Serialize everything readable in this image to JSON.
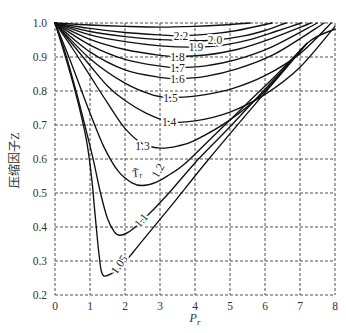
{
  "chart_data": {
    "type": "line",
    "title": "",
    "xlabel": "P_r",
    "xlabel_main": "P",
    "xlabel_sub": "r",
    "ylabel": "压缩因子Z",
    "xlim": [
      0,
      8
    ],
    "ylim": [
      0.2,
      1.0
    ],
    "xticks": [
      0,
      1,
      2,
      3,
      4,
      5,
      6,
      7,
      8
    ],
    "yticks": [
      0.2,
      0.3,
      0.4,
      0.5,
      0.6,
      0.7,
      0.8,
      0.9,
      1.0
    ],
    "grid": true,
    "grid_style": "dashed",
    "legend": null,
    "series": [
      {
        "name": "Tr (top, unlabeled)",
        "label": null,
        "label_pos": null,
        "label_rotate": 0,
        "points": [
          [
            0,
            1.0
          ],
          [
            1,
            0.994
          ],
          [
            2,
            0.99
          ],
          [
            3,
            0.988
          ],
          [
            4,
            0.99
          ],
          [
            4.8,
            0.994
          ],
          [
            5.57,
            1.0
          ]
        ]
      },
      {
        "name": "Tr=2.2",
        "label": "2.2",
        "label_pos": [
          3.6,
          0.962
        ],
        "label_rotate": 0,
        "points": [
          [
            0,
            1.0
          ],
          [
            1,
            0.984
          ],
          [
            2,
            0.972
          ],
          [
            3,
            0.965
          ],
          [
            3.6,
            0.963
          ],
          [
            4.4,
            0.967
          ],
          [
            5.2,
            0.978
          ],
          [
            6.2,
            1.0
          ]
        ]
      },
      {
        "name": "Tr=2.0",
        "label": "2.0",
        "label_pos": [
          4.57,
          0.951
        ],
        "label_rotate": 0,
        "points": [
          [
            0,
            1.0
          ],
          [
            1,
            0.975
          ],
          [
            2,
            0.96
          ],
          [
            3,
            0.951
          ],
          [
            4,
            0.948
          ],
          [
            4.6,
            0.95
          ],
          [
            5.4,
            0.962
          ],
          [
            6.0,
            0.978
          ],
          [
            6.6,
            1.0
          ]
        ]
      },
      {
        "name": "Tr=1.9",
        "label": "1.9",
        "label_pos": [
          4.03,
          0.929
        ],
        "label_rotate": 0,
        "points": [
          [
            0,
            1.0
          ],
          [
            1,
            0.965
          ],
          [
            2,
            0.945
          ],
          [
            3,
            0.933
          ],
          [
            4,
            0.929
          ],
          [
            4.8,
            0.935
          ],
          [
            5.6,
            0.952
          ],
          [
            6.3,
            0.975
          ],
          [
            7.03,
            1.0
          ]
        ]
      },
      {
        "name": "Tr=1.8",
        "label": "1.8",
        "label_pos": [
          3.5,
          0.901
        ],
        "label_rotate": 0,
        "points": [
          [
            0,
            1.0
          ],
          [
            1,
            0.952
          ],
          [
            2,
            0.922
          ],
          [
            3,
            0.905
          ],
          [
            3.5,
            0.902
          ],
          [
            4.3,
            0.906
          ],
          [
            5.2,
            0.922
          ],
          [
            6.2,
            0.955
          ],
          [
            7.31,
            1.0
          ]
        ]
      },
      {
        "name": "Tr=1.7",
        "label": "1.7",
        "label_pos": [
          3.5,
          0.868
        ],
        "label_rotate": 0,
        "points": [
          [
            0,
            1.0
          ],
          [
            1,
            0.935
          ],
          [
            2,
            0.893
          ],
          [
            3,
            0.873
          ],
          [
            3.5,
            0.869
          ],
          [
            4.3,
            0.874
          ],
          [
            5.2,
            0.893
          ],
          [
            6.2,
            0.93
          ],
          [
            7.49,
            1.0
          ]
        ]
      },
      {
        "name": "Tr=1.6",
        "label": "1.6",
        "label_pos": [
          3.5,
          0.835
        ],
        "label_rotate": 0,
        "points": [
          [
            0,
            1.0
          ],
          [
            1,
            0.915
          ],
          [
            2,
            0.862
          ],
          [
            3,
            0.84
          ],
          [
            3.5,
            0.836
          ],
          [
            4.3,
            0.843
          ],
          [
            5.2,
            0.865
          ],
          [
            6.3,
            0.91
          ],
          [
            7.69,
            1.0
          ]
        ]
      },
      {
        "name": "Tr=1.5",
        "label": "1.5",
        "label_pos": [
          3.3,
          0.78
        ],
        "label_rotate": 0,
        "points": [
          [
            0,
            1.0
          ],
          [
            1,
            0.895
          ],
          [
            2,
            0.823
          ],
          [
            2.8,
            0.788
          ],
          [
            3.3,
            0.781
          ],
          [
            4,
            0.785
          ],
          [
            5,
            0.805
          ],
          [
            6,
            0.845
          ],
          [
            7,
            0.91
          ],
          [
            7.89,
            1.0
          ]
        ]
      },
      {
        "name": "Tr=1.4",
        "label": "1.4",
        "label_pos": [
          3.26,
          0.709
        ],
        "label_rotate": 0,
        "points": [
          [
            0,
            1.0
          ],
          [
            1,
            0.875
          ],
          [
            1.5,
            0.815
          ],
          [
            2,
            0.772
          ],
          [
            2.6,
            0.735
          ],
          [
            3.26,
            0.71
          ],
          [
            4,
            0.712
          ],
          [
            5,
            0.738
          ],
          [
            6,
            0.79
          ],
          [
            7,
            0.87
          ],
          [
            8,
            0.99
          ]
        ]
      },
      {
        "name": "Tr=1.3",
        "label": "1.3",
        "label_pos": [
          2.5,
          0.637
        ],
        "label_rotate": 0,
        "points": [
          [
            0,
            1.0
          ],
          [
            0.5,
            0.925
          ],
          [
            1,
            0.845
          ],
          [
            1.5,
            0.765
          ],
          [
            2,
            0.69
          ],
          [
            2.5,
            0.645
          ],
          [
            3,
            0.632
          ],
          [
            3.5,
            0.638
          ],
          [
            4,
            0.655
          ],
          [
            5,
            0.715
          ],
          [
            6,
            0.8
          ],
          [
            7.2,
            0.94
          ],
          [
            8,
            0.982
          ]
        ]
      },
      {
        "name": "Tr=1.2",
        "label": "1.2",
        "label_pos": [
          2.94,
          0.566
        ],
        "label_rotate": -60,
        "points": [
          [
            0,
            1.0
          ],
          [
            0.3,
            0.925
          ],
          [
            0.6,
            0.845
          ],
          [
            1,
            0.735
          ],
          [
            1.4,
            0.635
          ],
          [
            1.8,
            0.565
          ],
          [
            2.2,
            0.53
          ],
          [
            2.5,
            0.522
          ],
          [
            2.9,
            0.532
          ],
          [
            3.3,
            0.556
          ],
          [
            3.7,
            0.585
          ],
          [
            4.5,
            0.665
          ],
          [
            5.5,
            0.765
          ],
          [
            6.3,
            0.845
          ],
          [
            7.2,
            0.94
          ]
        ]
      },
      {
        "name": "Tr=1.1",
        "label": "1.1",
        "label_pos": [
          2.46,
          0.42
        ],
        "label_rotate": -50,
        "points": [
          [
            0,
            1.0
          ],
          [
            0.3,
            0.91
          ],
          [
            0.6,
            0.8
          ],
          [
            0.9,
            0.68
          ],
          [
            1.1,
            0.595
          ],
          [
            1.3,
            0.5
          ],
          [
            1.5,
            0.425
          ],
          [
            1.7,
            0.385
          ],
          [
            1.85,
            0.376
          ],
          [
            2.1,
            0.385
          ],
          [
            2.4,
            0.41
          ],
          [
            2.8,
            0.45
          ],
          [
            3.3,
            0.505
          ],
          [
            4.1,
            0.6
          ],
          [
            5,
            0.695
          ],
          [
            6,
            0.805
          ],
          [
            7.2,
            0.94
          ]
        ]
      },
      {
        "name": "Tr=1.05",
        "label": "1.05",
        "label_pos": [
          1.83,
          0.29
        ],
        "label_rotate": -55,
        "points": [
          [
            0,
            1.0
          ],
          [
            0.3,
            0.9
          ],
          [
            0.6,
            0.79
          ],
          [
            0.9,
            0.655
          ],
          [
            1.05,
            0.54
          ],
          [
            1.15,
            0.43
          ],
          [
            1.25,
            0.325
          ],
          [
            1.32,
            0.272
          ],
          [
            1.4,
            0.256
          ],
          [
            1.6,
            0.262
          ],
          [
            1.9,
            0.285
          ],
          [
            2.23,
            0.326
          ],
          [
            2.7,
            0.385
          ],
          [
            3.3,
            0.46
          ],
          [
            4.37,
            0.597
          ],
          [
            5.5,
            0.735
          ],
          [
            6.5,
            0.855
          ],
          [
            7.2,
            0.94
          ]
        ]
      }
    ],
    "annotations": [
      {
        "text_main": "T̄",
        "text_sub": "r",
        "pos": [
          2.34,
          0.56
        ],
        "rotate": -15,
        "meaning": "reduced temperature symbol for curve family"
      }
    ]
  }
}
